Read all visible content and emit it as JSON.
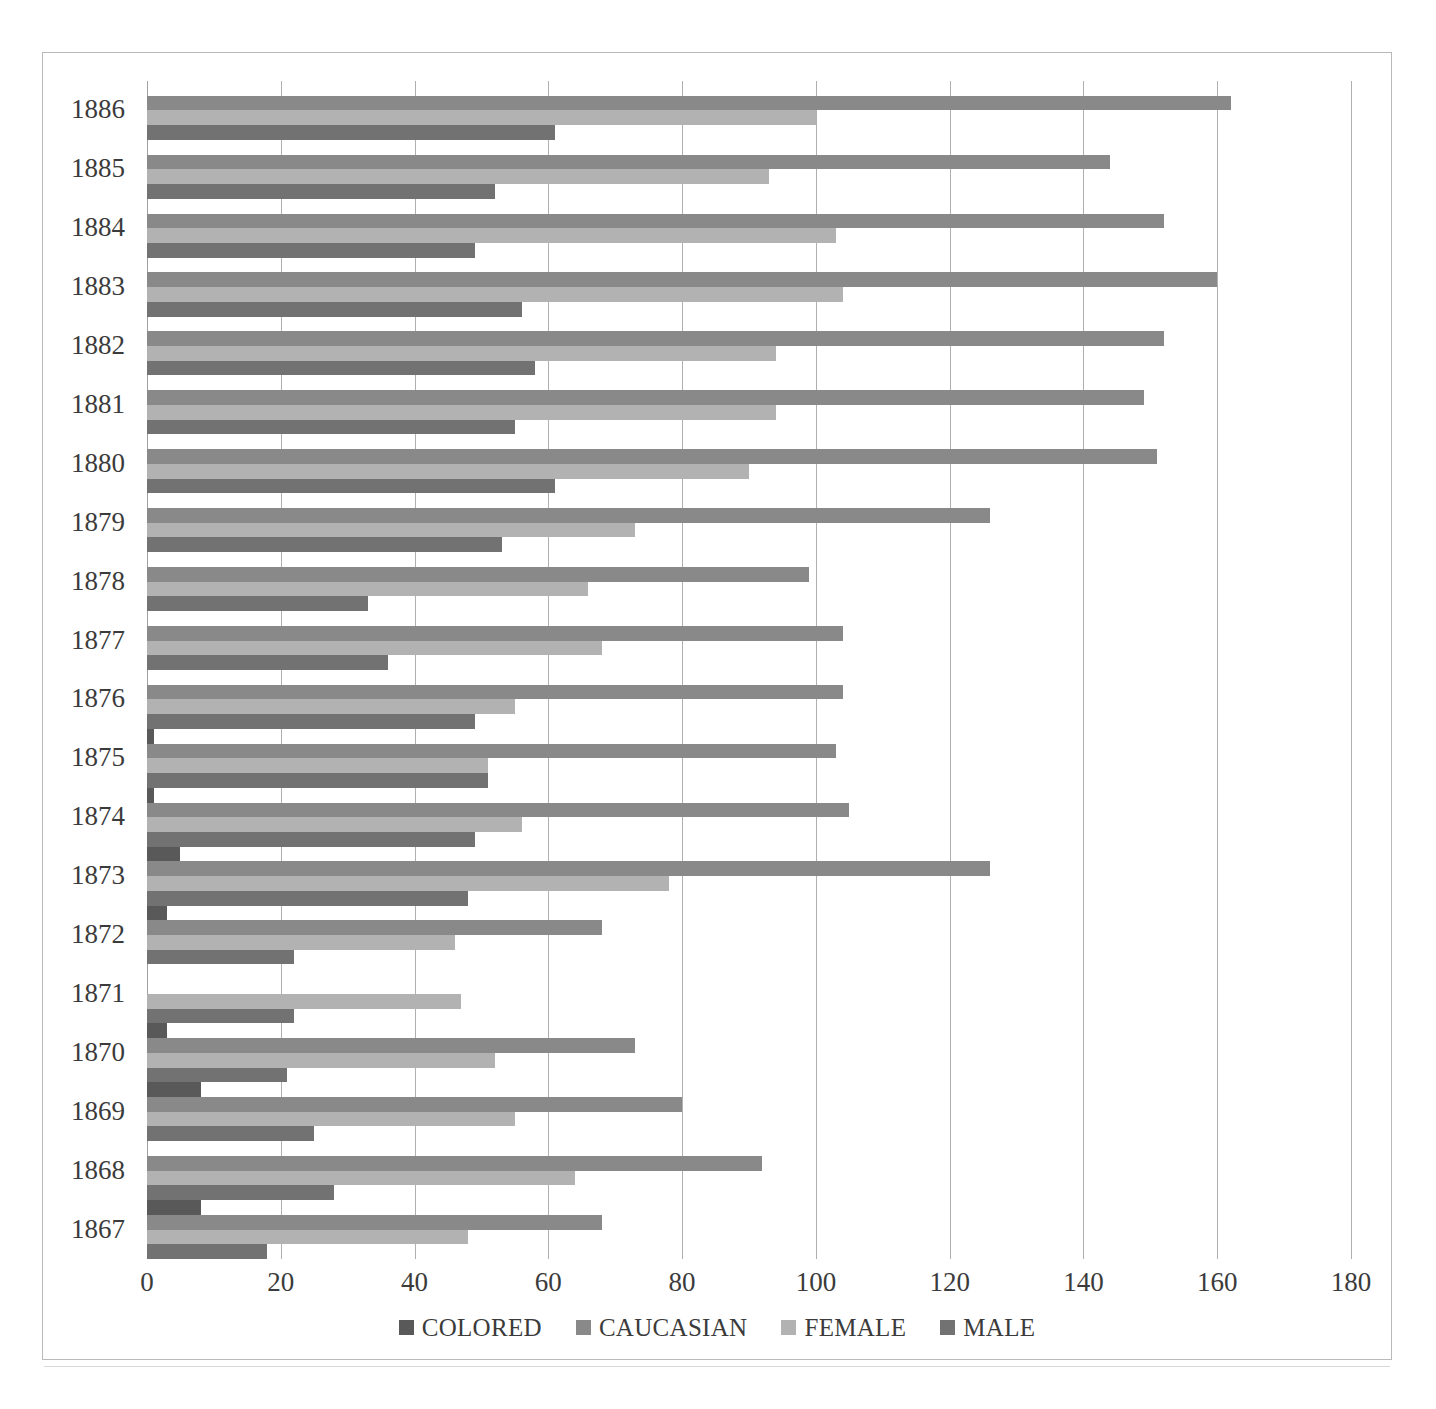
{
  "chart_data": {
    "type": "bar",
    "orientation": "horizontal",
    "title": "",
    "xlabel": "",
    "ylabel": "",
    "xlim": [
      0,
      180
    ],
    "xticks": [
      0,
      20,
      40,
      60,
      80,
      100,
      120,
      140,
      160,
      180
    ],
    "xtick_labels": [
      "0",
      "20",
      "40",
      "60",
      "80",
      "100",
      "120",
      "140",
      "160",
      "180"
    ],
    "grid": "vertical",
    "legend_position": "bottom",
    "categories": [
      "1886",
      "1885",
      "1884",
      "1883",
      "1882",
      "1881",
      "1880",
      "1879",
      "1878",
      "1877",
      "1876",
      "1875",
      "1874",
      "1873",
      "1872",
      "1871",
      "1870",
      "1869",
      "1868",
      "1867"
    ],
    "series": [
      {
        "name": "COLORED",
        "color": "#595959",
        "values": [
          0,
          0,
          0,
          0,
          0,
          0,
          0,
          0,
          0,
          0,
          0,
          1,
          1,
          5,
          3,
          0,
          3,
          8,
          0,
          8
        ]
      },
      {
        "name": "CAUCASIAN",
        "color": "#898989",
        "values": [
          162,
          144,
          152,
          160,
          152,
          149,
          151,
          126,
          99,
          104,
          104,
          103,
          105,
          126,
          68,
          0,
          73,
          80,
          92,
          68
        ]
      },
      {
        "name": "FEMALE",
        "color": "#b2b2b2",
        "values": [
          100,
          93,
          103,
          104,
          94,
          94,
          90,
          73,
          66,
          68,
          55,
          51,
          56,
          78,
          46,
          47,
          52,
          55,
          64,
          48
        ]
      },
      {
        "name": "MALE",
        "color": "#727272",
        "values": [
          61,
          52,
          49,
          56,
          58,
          55,
          61,
          53,
          33,
          36,
          49,
          51,
          49,
          48,
          22,
          22,
          21,
          25,
          28,
          18
        ]
      }
    ]
  },
  "legend": {
    "items": [
      {
        "label": "COLORED",
        "key": "colored"
      },
      {
        "label": "CAUCASIAN",
        "key": "caucasian"
      },
      {
        "label": "FEMALE",
        "key": "female"
      },
      {
        "label": "MALE",
        "key": "male"
      }
    ]
  },
  "colors": {
    "colored": "#595959",
    "caucasian": "#898989",
    "female": "#b2b2b2",
    "male": "#727272",
    "gridline": "#b0b0b0",
    "frame": "#b9b9b9",
    "text": "#3b3b3b"
  }
}
